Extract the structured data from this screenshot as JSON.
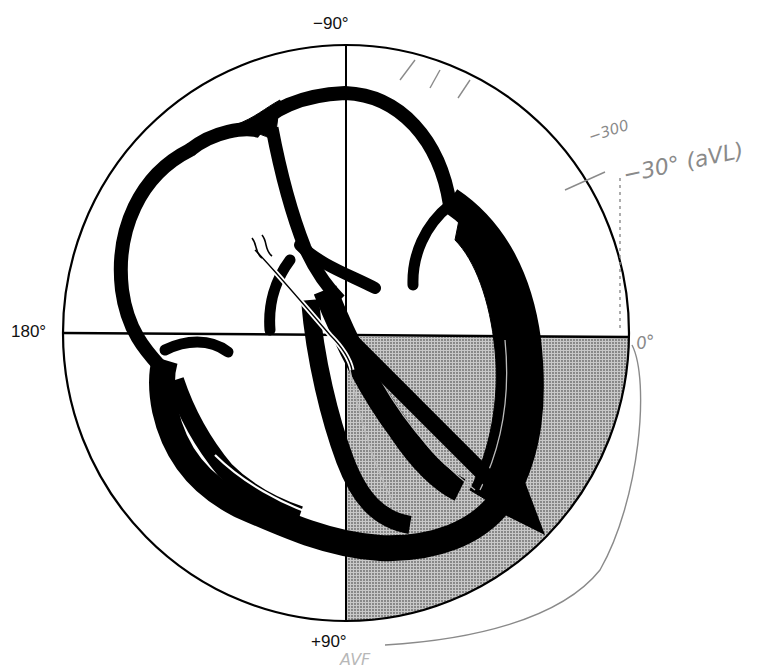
{
  "diagram": {
    "axis_labels": {
      "top": "−90°",
      "left": "180°",
      "right": "0°",
      "bottom": "+90°"
    },
    "shaded_quadrant": "0° to +90° (normal axis region)",
    "mean_vector_arrow": "points toward lower-right (~+45° to +60°)",
    "colors": {
      "ink": "#000000",
      "shading": "#a8a8a8",
      "pencil": "#8a8a8a",
      "background": "#ffffff"
    }
  },
  "annotations": {
    "handwritten_top": "−300",
    "handwritten_avl": "−30° (aVL)",
    "handwritten_right": "0°",
    "handwritten_bottom": "AVF"
  }
}
